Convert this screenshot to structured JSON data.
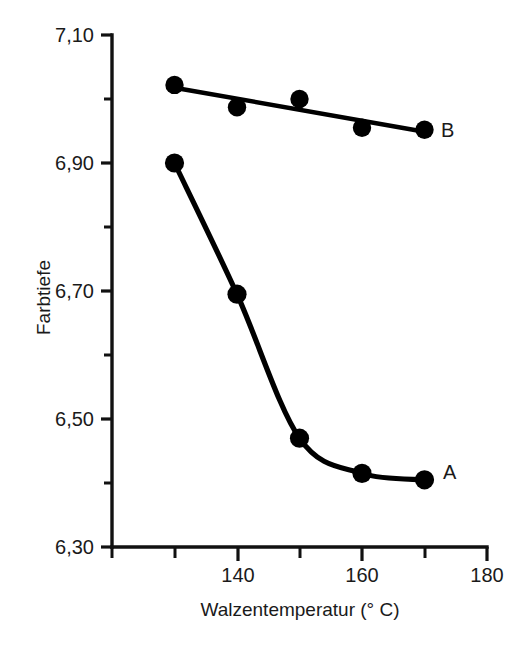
{
  "chart_data": {
    "type": "line",
    "title": "",
    "xlabel": "Walzentemperatur (° C)",
    "ylabel": "Farbtiefe",
    "xlim": [
      120,
      180
    ],
    "ylim": [
      6.3,
      7.1
    ],
    "x_major_ticks": [
      140,
      160,
      180
    ],
    "x_major_tick_labels": [
      "140",
      "160",
      "180"
    ],
    "x_minor_ticks": [
      120,
      130,
      150,
      170
    ],
    "y_major_ticks": [
      6.3,
      6.5,
      6.7,
      6.9,
      7.1
    ],
    "y_major_tick_labels": [
      "6,30",
      "6,50",
      "6,70",
      "6,90",
      "7,10"
    ],
    "y_minor_ticks": [
      6.4,
      6.6,
      6.8,
      7.0
    ],
    "grid": false,
    "legend_position": "inline-right",
    "decimal_separator": ",",
    "x": [
      130,
      140,
      150,
      160,
      170
    ],
    "series": [
      {
        "name": "A",
        "label": "A",
        "color": "#000000",
        "marker": "filled-circle",
        "line_style": "smooth-curve",
        "values": [
          6.9,
          6.695,
          6.47,
          6.415,
          6.405
        ]
      },
      {
        "name": "B",
        "label": "B",
        "color": "#000000",
        "marker": "filled-circle",
        "line_style": "straight-fit",
        "values": [
          7.022,
          6.987,
          7.0,
          6.955,
          6.952
        ]
      }
    ]
  },
  "axes": {
    "y_tick_labels": [
      {
        "text": "7,10",
        "value": 7.1
      },
      {
        "text": "6,90",
        "value": 6.9
      },
      {
        "text": "6,70",
        "value": 6.7
      },
      {
        "text": "6,50",
        "value": 6.5
      },
      {
        "text": "6,30",
        "value": 6.3
      }
    ],
    "x_tick_labels": [
      {
        "text": "140",
        "value": 140
      },
      {
        "text": "160",
        "value": 160
      },
      {
        "text": "180",
        "value": 180
      }
    ],
    "y_title": "Farbtiefe",
    "x_title": "Walzentemperatur (° C)"
  },
  "series_labels": {
    "a": "A",
    "b": "B"
  },
  "colors": {
    "ink": "#000000",
    "text": "#1a1a1a",
    "background": "#ffffff"
  }
}
